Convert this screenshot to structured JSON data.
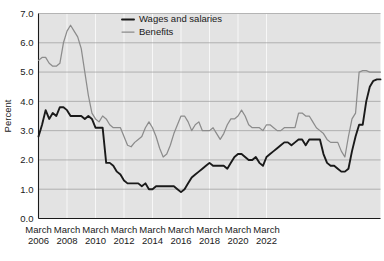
{
  "chart_data": {
    "type": "line",
    "title": "",
    "xlabel": "",
    "ylabel": "Percent",
    "ylim": [
      0.0,
      7.0
    ],
    "ytick_values": [
      0.0,
      1.0,
      2.0,
      3.0,
      4.0,
      5.0,
      6.0,
      7.0
    ],
    "ytick_labels": [
      "0.0",
      "1.0",
      "2.0",
      "3.0",
      "4.0",
      "5.0",
      "6.0",
      "7.0"
    ],
    "xtick_labels": [
      "March\n2006",
      "March\n2008",
      "March\n2010",
      "March\n2012",
      "March\n2014",
      "March\n2016",
      "March\n2018",
      "March\n2020",
      "March\n2022"
    ],
    "xtick_month": "March",
    "xtick_years": [
      "2006",
      "2008",
      "2010",
      "2012",
      "2014",
      "2016",
      "2018",
      "2020",
      "2022"
    ],
    "x_start": 2006.0,
    "x_end": 2023.25,
    "x_step_quarters": 0.25,
    "grid": "horizontal-major-and-vertical-minor",
    "legend_position": "top-center",
    "plot_background": "#e3e3e3",
    "series": [
      {
        "name": "Wages and salaries",
        "color": "#1a1a1a",
        "values": [
          2.8,
          3.2,
          3.7,
          3.4,
          3.6,
          3.5,
          3.8,
          3.8,
          3.7,
          3.5,
          3.5,
          3.5,
          3.5,
          3.4,
          3.5,
          3.4,
          3.1,
          3.1,
          3.1,
          1.9,
          1.9,
          1.8,
          1.6,
          1.5,
          1.3,
          1.2,
          1.2,
          1.2,
          1.2,
          1.1,
          1.2,
          1.0,
          1.0,
          1.1,
          1.1,
          1.1,
          1.1,
          1.1,
          1.1,
          1.0,
          0.9,
          1.0,
          1.2,
          1.4,
          1.5,
          1.6,
          1.7,
          1.8,
          1.9,
          1.8,
          1.8,
          1.8,
          1.8,
          1.7,
          1.9,
          2.1,
          2.2,
          2.2,
          2.1,
          2.0,
          2.0,
          2.1,
          1.9,
          1.8,
          2.1,
          2.2,
          2.3,
          2.4,
          2.5,
          2.6,
          2.6,
          2.5,
          2.6,
          2.7,
          2.7,
          2.5,
          2.7,
          2.7,
          2.7,
          2.7,
          2.2,
          1.9,
          1.8,
          1.8,
          1.7,
          1.6,
          1.6,
          1.7,
          2.3,
          2.8,
          3.2,
          3.2,
          4.0,
          4.5,
          4.7,
          4.75,
          4.75
        ]
      },
      {
        "name": "Benefits",
        "color": "#8c8c8c",
        "values": [
          5.4,
          5.5,
          5.5,
          5.3,
          5.2,
          5.2,
          5.3,
          6.0,
          6.4,
          6.6,
          6.4,
          6.2,
          5.8,
          5.0,
          4.2,
          3.6,
          3.4,
          3.3,
          3.5,
          3.4,
          3.2,
          3.1,
          3.1,
          3.1,
          2.8,
          2.5,
          2.45,
          2.6,
          2.7,
          2.8,
          3.1,
          3.3,
          3.1,
          2.8,
          2.4,
          2.1,
          2.2,
          2.5,
          2.9,
          3.2,
          3.5,
          3.5,
          3.3,
          3.0,
          3.2,
          3.3,
          3.0,
          3.0,
          3.0,
          3.1,
          2.9,
          2.7,
          2.9,
          3.2,
          3.4,
          3.4,
          3.5,
          3.7,
          3.5,
          3.2,
          3.1,
          3.1,
          3.1,
          3.0,
          3.2,
          3.2,
          3.1,
          3.0,
          3.0,
          3.1,
          3.1,
          3.1,
          3.1,
          3.6,
          3.6,
          3.5,
          3.5,
          3.3,
          3.1,
          3.0,
          2.9,
          2.7,
          2.6,
          2.6,
          2.6,
          2.3,
          2.1,
          2.8,
          3.4,
          3.6,
          5.0,
          5.05,
          5.05,
          5.0,
          5.0,
          5.0,
          5.0
        ]
      }
    ]
  },
  "legend": {
    "entries": [
      {
        "label": "Wages and salaries",
        "marker": "line-black"
      },
      {
        "label": "Benefits",
        "marker": "line-gray"
      }
    ]
  }
}
